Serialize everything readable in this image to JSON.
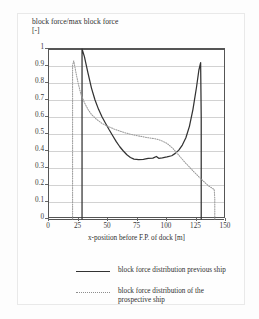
{
  "figure": {
    "title_line1": "block force/max block force",
    "title_line2": "[-]",
    "title": "block force/max block force\n[-]"
  },
  "axes": {
    "y_ticks": [
      "1",
      "0.9",
      "0.8",
      "0.7",
      "0.6",
      "0.5",
      "0.4",
      "0.3",
      "0.2",
      "0.1",
      "0"
    ],
    "x_ticks": [
      "0",
      "25",
      "50",
      "75",
      "100",
      "125",
      "150"
    ],
    "x_title": "x-position before F.P. of dock [m]",
    "y_title": "block force/max block force [-]"
  },
  "legend": {
    "items": [
      {
        "label": "block force distribution previous ship",
        "style": "solid",
        "color": "#333333"
      },
      {
        "label": "block force distribution of the\nprospective ship",
        "style": "dotted",
        "color": "#8d8d8d"
      }
    ]
  },
  "chart_data": {
    "type": "line",
    "title": "block force/max block force [-]",
    "xlabel": "x-position before F.P. of dock [m]",
    "ylabel": "block force/max block force [-]",
    "xlim": [
      0,
      150
    ],
    "ylim": [
      0,
      1
    ],
    "xticks": [
      0,
      25,
      50,
      75,
      100,
      125,
      150
    ],
    "yticks": [
      0,
      0.1,
      0.2,
      0.3,
      0.4,
      0.5,
      0.6,
      0.7,
      0.8,
      0.9,
      1
    ],
    "grid": "horizontal",
    "legend_position": "below-plot",
    "series": [
      {
        "name": "block force distribution previous ship",
        "style": "solid",
        "color": "#333333",
        "points": [
          [
            28,
            0
          ],
          [
            28,
            1
          ],
          [
            30,
            0.955
          ],
          [
            33,
            0.86
          ],
          [
            36,
            0.77
          ],
          [
            39,
            0.7
          ],
          [
            42,
            0.645
          ],
          [
            45,
            0.6
          ],
          [
            48,
            0.562
          ],
          [
            51,
            0.525
          ],
          [
            54,
            0.49
          ],
          [
            57,
            0.455
          ],
          [
            60,
            0.425
          ],
          [
            63,
            0.4
          ],
          [
            66,
            0.378
          ],
          [
            69,
            0.362
          ],
          [
            72,
            0.352
          ],
          [
            76,
            0.349
          ],
          [
            80,
            0.351
          ],
          [
            84,
            0.356
          ],
          [
            88,
            0.358
          ],
          [
            91,
            0.368
          ],
          [
            93,
            0.357
          ],
          [
            96,
            0.36
          ],
          [
            100,
            0.365
          ],
          [
            104,
            0.372
          ],
          [
            107,
            0.386
          ],
          [
            110,
            0.405
          ],
          [
            113,
            0.435
          ],
          [
            116,
            0.478
          ],
          [
            119,
            0.545
          ],
          [
            122,
            0.645
          ],
          [
            125,
            0.775
          ],
          [
            127,
            0.875
          ],
          [
            128.5,
            0.92
          ],
          [
            129,
            0.6
          ],
          [
            129,
            0
          ]
        ]
      },
      {
        "name": "block force distribution of the prospective ship",
        "style": "dotted",
        "color": "#8d8d8d",
        "points": [
          [
            20,
            0
          ],
          [
            20,
            0.905
          ],
          [
            21,
            0.93
          ],
          [
            23,
            0.855
          ],
          [
            25,
            0.79
          ],
          [
            27,
            0.735
          ],
          [
            30,
            0.685
          ],
          [
            33,
            0.645
          ],
          [
            36,
            0.615
          ],
          [
            40,
            0.588
          ],
          [
            45,
            0.562
          ],
          [
            50,
            0.545
          ],
          [
            55,
            0.53
          ],
          [
            60,
            0.517
          ],
          [
            65,
            0.506
          ],
          [
            70,
            0.497
          ],
          [
            75,
            0.49
          ],
          [
            80,
            0.483
          ],
          [
            85,
            0.477
          ],
          [
            90,
            0.472
          ],
          [
            95,
            0.462
          ],
          [
            100,
            0.445
          ],
          [
            105,
            0.415
          ],
          [
            110,
            0.375
          ],
          [
            115,
            0.335
          ],
          [
            120,
            0.298
          ],
          [
            125,
            0.262
          ],
          [
            130,
            0.228
          ],
          [
            135,
            0.196
          ],
          [
            139,
            0.178
          ],
          [
            140,
            0.175
          ],
          [
            140.5,
            0.12
          ],
          [
            140.5,
            0
          ]
        ]
      }
    ]
  }
}
